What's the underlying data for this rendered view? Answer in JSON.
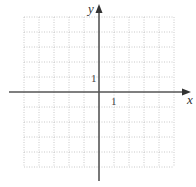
{
  "diagram": {
    "type": "coordinate-grid",
    "x_axis_label": "x",
    "y_axis_label": "y",
    "x_tick_label": "1",
    "y_tick_label": "1",
    "x_range": [
      -5,
      5
    ],
    "y_range": [
      -5,
      5
    ],
    "grid_style": "dotted",
    "colors": {
      "axis": "#555555",
      "grid": "#bbbbbb",
      "background": "#ffffff"
    }
  }
}
